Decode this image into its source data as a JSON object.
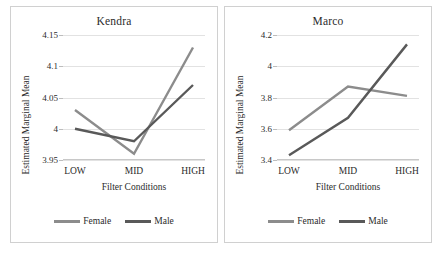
{
  "figure": {
    "background": "#ffffff",
    "panel_border_color": "#d0d0d0",
    "gridline_color": "#e2e2e2"
  },
  "legend": {
    "female_label": "Female",
    "male_label": "Male",
    "female_color": "#8c8c8c",
    "male_color": "#595959",
    "position": "bottom-center"
  },
  "chart_data": [
    {
      "type": "line",
      "title": "Kendra",
      "xlabel": "Filter Conditions",
      "ylabel": "Estimated Marginal Mean",
      "categories": [
        "LOW",
        "MID",
        "HIGH"
      ],
      "yticks": [
        "3.95",
        "4",
        "4.05",
        "4.1",
        "4.15"
      ],
      "ylim": [
        3.95,
        4.15
      ],
      "grid": true,
      "series": [
        {
          "name": "Female",
          "color": "#8c8c8c",
          "values": [
            4.03,
            3.96,
            4.13
          ]
        },
        {
          "name": "Male",
          "color": "#595959",
          "values": [
            4.0,
            3.98,
            4.07
          ]
        }
      ]
    },
    {
      "type": "line",
      "title": "Marco",
      "xlabel": "Filter Conditions",
      "ylabel": "Estimated Marginal Mean",
      "categories": [
        "LOW",
        "MID",
        "HIGH"
      ],
      "yticks": [
        "3.4",
        "3.6",
        "3.8",
        "4",
        "4.2"
      ],
      "ylim": [
        3.4,
        4.2
      ],
      "grid": true,
      "series": [
        {
          "name": "Female",
          "color": "#8c8c8c",
          "values": [
            3.59,
            3.87,
            3.81
          ]
        },
        {
          "name": "Male",
          "color": "#595959",
          "values": [
            3.43,
            3.67,
            4.14
          ]
        }
      ]
    }
  ]
}
